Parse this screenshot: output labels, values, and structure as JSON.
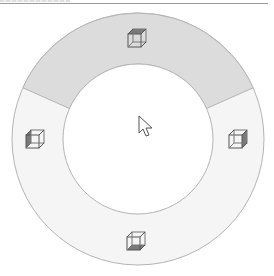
{
  "header": {
    "title_cropped": ""
  },
  "pie_menu": {
    "center": [
      138,
      139
    ],
    "outer_radius": 126,
    "inner_radius": 75,
    "colors": {
      "selected_segment": "#dcdcdc",
      "segment": "#f5f5f5",
      "center": "#ffffff",
      "stroke": "#b4b4b4",
      "icon": "#555555"
    },
    "segments": [
      {
        "name": "top",
        "icon": "cube-icon-top-face",
        "selected": true
      },
      {
        "name": "right",
        "icon": "cube-icon-right-face",
        "selected": false
      },
      {
        "name": "bottom",
        "icon": "cube-icon-bottom-face",
        "selected": false
      },
      {
        "name": "left",
        "icon": "cube-icon-left-face",
        "selected": false
      }
    ]
  },
  "cursor": {
    "icon": "arrow-pointer-icon",
    "x": 138,
    "y": 117
  }
}
